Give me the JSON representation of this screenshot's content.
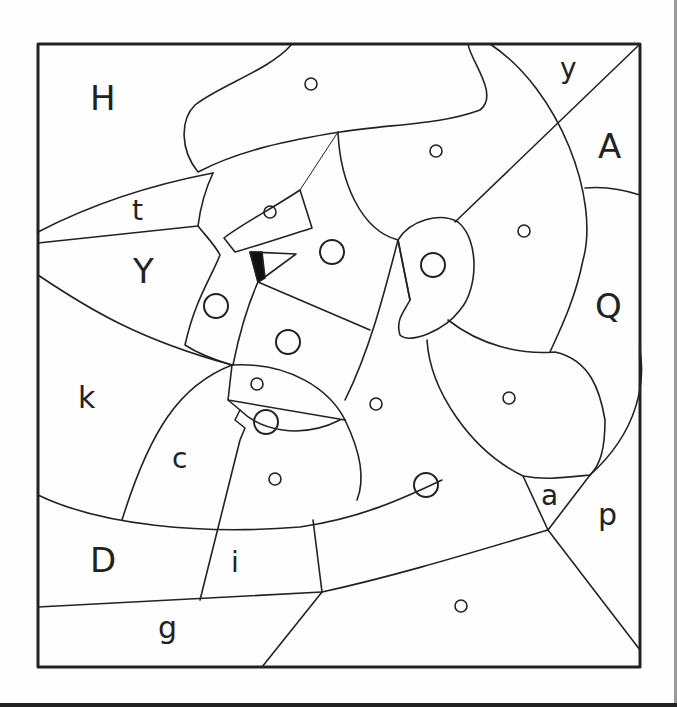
{
  "letter_labels": [
    {
      "id": "H",
      "text": "H"
    },
    {
      "id": "y",
      "text": "y"
    },
    {
      "id": "A",
      "text": "A"
    },
    {
      "id": "t",
      "text": "t"
    },
    {
      "id": "Y",
      "text": "Y"
    },
    {
      "id": "Q",
      "text": "Q"
    },
    {
      "id": "k",
      "text": "k"
    },
    {
      "id": "c",
      "text": "c"
    },
    {
      "id": "a",
      "text": "a"
    },
    {
      "id": "p",
      "text": "p"
    },
    {
      "id": "D",
      "text": "D"
    },
    {
      "id": "i",
      "text": "i"
    },
    {
      "id": "g",
      "text": "g"
    }
  ],
  "circle_markers": {
    "small_count": 10,
    "large_count": 7
  }
}
